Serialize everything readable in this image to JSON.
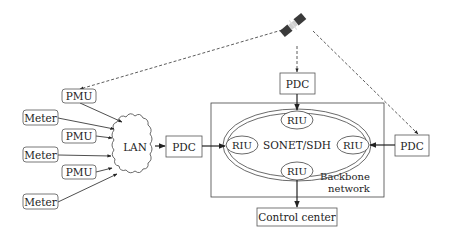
{
  "diagram": {
    "title": "",
    "nodes": {
      "pmu_top": {
        "label": "PMU"
      },
      "meter_1": {
        "label": "Meter"
      },
      "pmu_2": {
        "label": "PMU"
      },
      "meter_2": {
        "label": "Meter"
      },
      "pmu_3": {
        "label": "PMU"
      },
      "meter_3": {
        "label": "Meter"
      },
      "lan": {
        "label": "LAN"
      },
      "pdc_left": {
        "label": "PDC"
      },
      "pdc_top": {
        "label": "PDC"
      },
      "pdc_right": {
        "label": "PDC"
      },
      "riu_top": {
        "label": "RIU"
      },
      "riu_left": {
        "label": "RIU"
      },
      "riu_right": {
        "label": "RIU"
      },
      "riu_bottom": {
        "label": "RIU"
      },
      "ring": {
        "label": "SONET/SDH"
      },
      "backbone": {
        "label_line1": "Backbone",
        "label_line2": "network"
      },
      "control_center": {
        "label": "Control center"
      },
      "satellite": {
        "label": "satellite-icon"
      }
    },
    "edges": [
      {
        "from": "satellite",
        "to": "pmu_top",
        "style": "dashed"
      },
      {
        "from": "satellite",
        "to": "pdc_top",
        "style": "dashed"
      },
      {
        "from": "satellite",
        "to": "pdc_right",
        "style": "dashed"
      },
      {
        "from": "pmu_top",
        "to": "lan",
        "style": "solid"
      },
      {
        "from": "meter_1",
        "to": "lan",
        "style": "solid"
      },
      {
        "from": "pmu_2",
        "to": "lan",
        "style": "solid"
      },
      {
        "from": "meter_2",
        "to": "lan",
        "style": "solid"
      },
      {
        "from": "pmu_3",
        "to": "lan",
        "style": "solid"
      },
      {
        "from": "meter_3",
        "to": "lan",
        "style": "solid"
      },
      {
        "from": "lan",
        "to": "pdc_left",
        "style": "solid"
      },
      {
        "from": "pdc_left",
        "to": "riu_left",
        "style": "solid"
      },
      {
        "from": "pdc_top",
        "to": "riu_top",
        "style": "solid"
      },
      {
        "from": "pdc_right",
        "to": "riu_right",
        "style": "solid"
      },
      {
        "from": "riu_bottom",
        "to": "control_center",
        "style": "solid"
      }
    ],
    "colors": {
      "stroke": "#333333",
      "box_stroke": "#555555",
      "background": "#ffffff"
    }
  }
}
